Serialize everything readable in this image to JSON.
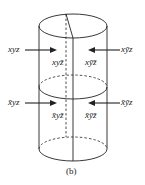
{
  "diagram": {
    "shape": "cylinder split by a vertical plane and a horizontal plane into four regions",
    "labels": {
      "top_left_outside": "xyz",
      "top_right_outside": "xȳz",
      "top_left_inside": "xyz̄",
      "top_right_inside": "xȳz̄",
      "bottom_left_outside": "x̄yz",
      "bottom_right_outside": "x̄ȳz",
      "bottom_left_inside": "x̄yz̄",
      "bottom_right_inside": "x̄ȳz̄"
    },
    "caption": "(b)",
    "colors": {
      "stroke": "#222222",
      "background": "#ffffff"
    }
  }
}
